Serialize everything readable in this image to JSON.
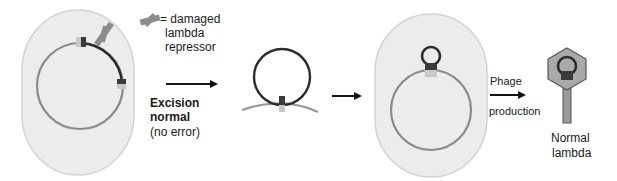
{
  "legend": {
    "icon": "damaged-repressor-icon",
    "line1": "= damaged",
    "line2": "lambda",
    "line3": "repressor"
  },
  "step1": {
    "title_line1": "Excision",
    "title_line2": "normal",
    "note": "(no error)"
  },
  "step3": {
    "arrow_top": "Phage",
    "arrow_bottom": "production"
  },
  "result": {
    "line1": "Normal",
    "line2": "lambda"
  },
  "colors": {
    "cell_fill": "#ececec",
    "cell_stroke": "#cfcfcf",
    "bacterial_dna": "#8a8a8a",
    "prophage_dna": "#2b2b2b",
    "repressor": "#8c8c8c",
    "att_dark": "#3a3a3a",
    "att_light": "#c8c8c8",
    "phage_head": "#a9a9a9"
  }
}
